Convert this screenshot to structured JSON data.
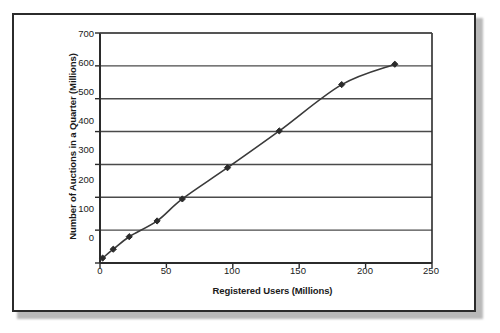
{
  "chart_data": {
    "type": "line",
    "title": "",
    "subtitle": "",
    "xlabel": "Registered Users (Millions)",
    "ylabel": "Number of Auctions in a Quarter (Millions)",
    "xlim": [
      0,
      250
    ],
    "ylim": [
      0,
      700
    ],
    "x_ticks": [
      "0",
      "50",
      "100",
      "150",
      "200",
      "250"
    ],
    "y_ticks": [
      "0",
      "100",
      "200",
      "300",
      "400",
      "500",
      "600",
      "700"
    ],
    "x_tick_values": [
      0,
      50,
      100,
      150,
      200,
      250
    ],
    "y_tick_values": [
      0,
      100,
      200,
      300,
      400,
      500,
      600,
      700
    ],
    "grid": "horizontal",
    "legend": "none",
    "series": [
      {
        "name": "Auctions vs Registered Users",
        "marker": "diamond",
        "color": "#3a3a3a",
        "x": [
          2,
          10,
          22,
          43,
          62,
          96,
          135,
          182,
          222
        ],
        "y": [
          15,
          42,
          80,
          128,
          195,
          290,
          402,
          543,
          605
        ]
      }
    ],
    "points": [
      {
        "x": 2,
        "y": 15
      },
      {
        "x": 10,
        "y": 42
      },
      {
        "x": 22,
        "y": 80
      },
      {
        "x": 43,
        "y": 128
      },
      {
        "x": 62,
        "y": 195
      },
      {
        "x": 96,
        "y": 290
      },
      {
        "x": 135,
        "y": 402
      },
      {
        "x": 182,
        "y": 543
      },
      {
        "x": 222,
        "y": 605
      }
    ],
    "colors": {
      "line": "#3a3a3a",
      "marker": "#2b2b2b",
      "axis": "#2b2b2b",
      "grid": "#4a4a4a",
      "background": "#ffffff",
      "frame": "#2b2b2b"
    }
  }
}
